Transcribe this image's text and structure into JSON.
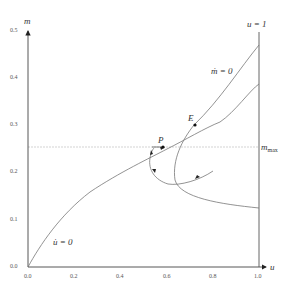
{
  "diagram": {
    "axes": {
      "x_label": "u",
      "y_label": "m",
      "x_ticks": [
        "0.0",
        "0.2",
        "0.4",
        "0.6",
        "0.8",
        "1.0"
      ],
      "y_ticks": [
        "0.0",
        "0.1",
        "0.2",
        "0.3",
        "0.4",
        "0.5"
      ]
    },
    "labels": {
      "u_equals_1": "u = 1",
      "u_dot_zero": "u̇ = 0",
      "m_dot_zero": "ṁ = 0",
      "m_max_base": "m",
      "m_max_sub": "max",
      "point_P": "P",
      "point_E": "E"
    },
    "colors": {
      "axis": "#444444",
      "curve": "#777777",
      "dashed": "#bbbbbb",
      "point": "#111111"
    }
  }
}
